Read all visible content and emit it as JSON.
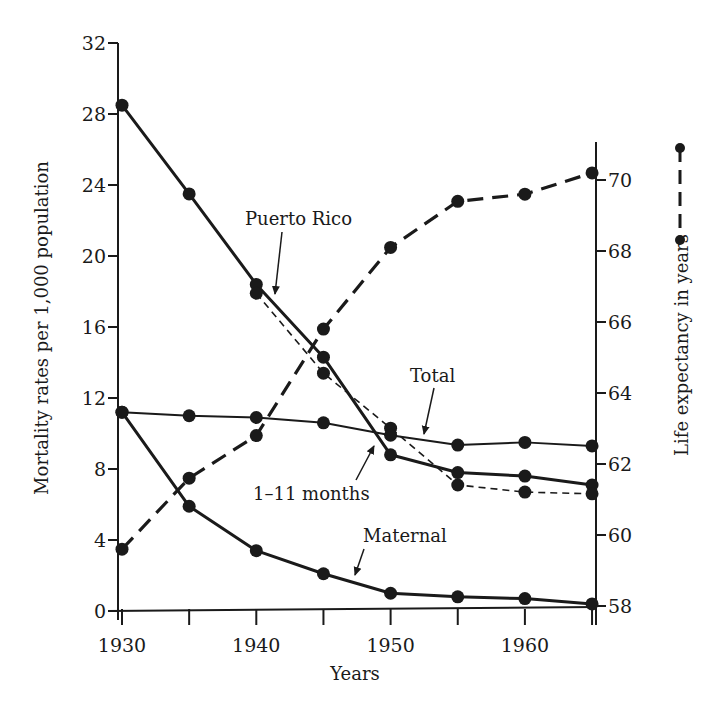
{
  "chart_data": {
    "type": "line",
    "title": "",
    "xlabel": "Years",
    "ylabel": "Mortality rates per 1,000 population",
    "y2label": "Life expectancy in years",
    "x": [
      1930,
      1935,
      1940,
      1945,
      1950,
      1955,
      1960,
      1965
    ],
    "x_ticks": [
      1930,
      1935,
      1940,
      1945,
      1950,
      1955,
      1960,
      1965
    ],
    "x_tick_labels": [
      "1930",
      "1940",
      "1950",
      "1960"
    ],
    "xlim": [
      1930,
      1965
    ],
    "ylim": [
      0,
      32
    ],
    "y_ticks": [
      0,
      4,
      8,
      12,
      16,
      20,
      24,
      28,
      32
    ],
    "y2lim": [
      58,
      71
    ],
    "y2_ticks": [
      58,
      60,
      62,
      64,
      66,
      68,
      70
    ],
    "grid": false,
    "legend": {
      "position": "right, outside plot",
      "entries": [
        {
          "label": "Life expectancy in years",
          "style": "dashed with dot markers"
        }
      ]
    },
    "series": [
      {
        "name": "1-11 months",
        "axis": "left",
        "style": "solid-thick",
        "values": [
          28.5,
          23.5,
          18.4,
          14.3,
          8.8,
          7.8,
          7.6,
          7.1
        ]
      },
      {
        "name": "Puerto Rico",
        "axis": "left",
        "style": "dashed-thin",
        "values": [
          null,
          null,
          17.9,
          13.4,
          10.3,
          7.1,
          6.7,
          6.6
        ]
      },
      {
        "name": "Total",
        "axis": "left",
        "style": "solid-thin",
        "values": [
          11.2,
          11.0,
          10.9,
          10.6,
          9.9,
          9.35,
          9.5,
          9.3
        ]
      },
      {
        "name": "Maternal",
        "axis": "left",
        "style": "solid-thick",
        "values": [
          11.2,
          5.9,
          3.4,
          2.1,
          1.0,
          0.8,
          0.7,
          0.4
        ]
      },
      {
        "name": "Life expectancy",
        "axis": "right",
        "style": "dashed-thick",
        "values": [
          59.6,
          61.6,
          62.8,
          65.8,
          68.1,
          69.4,
          69.6,
          70.2
        ]
      }
    ],
    "annotations": [
      {
        "text": "Puerto Rico",
        "points_to": "Puerto Rico series near 1942"
      },
      {
        "text": "Total",
        "points_to": "Total series near 1952"
      },
      {
        "text": "1–11 months",
        "points_to": "1-11 months series near 1948"
      },
      {
        "text": "Maternal",
        "points_to": "Maternal series near 1947"
      }
    ]
  },
  "labels": {
    "xlabel": "Years",
    "ylabel": "Mortality rates per 1,000 population",
    "y2label": "Life expectancy in years",
    "puerto_rico": "Puerto Rico",
    "total": "Total",
    "months": "1–11 months",
    "maternal": "Maternal"
  },
  "colors": {
    "ink": "#1a1a1a",
    "background": "#ffffff"
  }
}
